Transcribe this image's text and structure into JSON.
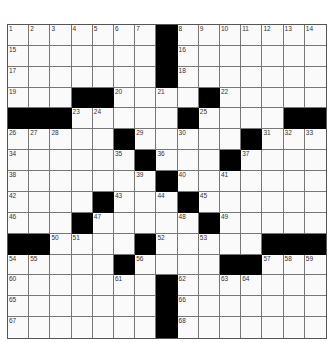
{
  "puzzle": {
    "rows": 15,
    "cols": 15,
    "colors": {
      "black": "#000000",
      "white": "#fafafa",
      "grid_line": "#777777"
    },
    "black_cells": [
      [
        0,
        7
      ],
      [
        1,
        7
      ],
      [
        2,
        7
      ],
      [
        3,
        3
      ],
      [
        3,
        4
      ],
      [
        3,
        9
      ],
      [
        4,
        0
      ],
      [
        4,
        1
      ],
      [
        4,
        2
      ],
      [
        4,
        8
      ],
      [
        4,
        13
      ],
      [
        4,
        14
      ],
      [
        5,
        5
      ],
      [
        5,
        11
      ],
      [
        6,
        6
      ],
      [
        6,
        10
      ],
      [
        7,
        7
      ],
      [
        8,
        4
      ],
      [
        8,
        8
      ],
      [
        9,
        3
      ],
      [
        9,
        9
      ],
      [
        10,
        0
      ],
      [
        10,
        1
      ],
      [
        10,
        6
      ],
      [
        10,
        12
      ],
      [
        10,
        13
      ],
      [
        10,
        14
      ],
      [
        11,
        5
      ],
      [
        11,
        10
      ],
      [
        11,
        11
      ],
      [
        12,
        7
      ],
      [
        13,
        7
      ],
      [
        14,
        7
      ]
    ],
    "numbers": [
      {
        "r": 0,
        "c": 0,
        "n": "1"
      },
      {
        "r": 0,
        "c": 1,
        "n": "2"
      },
      {
        "r": 0,
        "c": 2,
        "n": "3"
      },
      {
        "r": 0,
        "c": 3,
        "n": "4"
      },
      {
        "r": 0,
        "c": 4,
        "n": "5"
      },
      {
        "r": 0,
        "c": 5,
        "n": "6"
      },
      {
        "r": 0,
        "c": 6,
        "n": "7"
      },
      {
        "r": 0,
        "c": 8,
        "n": "8"
      },
      {
        "r": 0,
        "c": 9,
        "n": "9"
      },
      {
        "r": 0,
        "c": 10,
        "n": "10"
      },
      {
        "r": 0,
        "c": 11,
        "n": "11"
      },
      {
        "r": 0,
        "c": 12,
        "n": "12"
      },
      {
        "r": 0,
        "c": 13,
        "n": "13"
      },
      {
        "r": 0,
        "c": 14,
        "n": "14"
      },
      {
        "r": 1,
        "c": 0,
        "n": "15"
      },
      {
        "r": 1,
        "c": 8,
        "n": "16"
      },
      {
        "r": 2,
        "c": 0,
        "n": "17"
      },
      {
        "r": 2,
        "c": 8,
        "n": "18"
      },
      {
        "r": 3,
        "c": 0,
        "n": "19"
      },
      {
        "r": 3,
        "c": 5,
        "n": "20"
      },
      {
        "r": 3,
        "c": 7,
        "n": "21"
      },
      {
        "r": 3,
        "c": 10,
        "n": "22"
      },
      {
        "r": 4,
        "c": 3,
        "n": "23"
      },
      {
        "r": 4,
        "c": 4,
        "n": "24"
      },
      {
        "r": 4,
        "c": 9,
        "n": "25"
      },
      {
        "r": 5,
        "c": 0,
        "n": "26"
      },
      {
        "r": 5,
        "c": 1,
        "n": "27"
      },
      {
        "r": 5,
        "c": 2,
        "n": "28"
      },
      {
        "r": 5,
        "c": 6,
        "n": "29"
      },
      {
        "r": 5,
        "c": 8,
        "n": "30"
      },
      {
        "r": 5,
        "c": 12,
        "n": "31"
      },
      {
        "r": 5,
        "c": 13,
        "n": "32"
      },
      {
        "r": 5,
        "c": 14,
        "n": "33"
      },
      {
        "r": 6,
        "c": 0,
        "n": "34"
      },
      {
        "r": 6,
        "c": 5,
        "n": "35"
      },
      {
        "r": 6,
        "c": 7,
        "n": "36"
      },
      {
        "r": 6,
        "c": 11,
        "n": "37"
      },
      {
        "r": 7,
        "c": 0,
        "n": "38"
      },
      {
        "r": 7,
        "c": 6,
        "n": "39"
      },
      {
        "r": 7,
        "c": 8,
        "n": "40"
      },
      {
        "r": 7,
        "c": 10,
        "n": "41"
      },
      {
        "r": 8,
        "c": 0,
        "n": "42"
      },
      {
        "r": 8,
        "c": 5,
        "n": "43"
      },
      {
        "r": 8,
        "c": 7,
        "n": "44"
      },
      {
        "r": 8,
        "c": 9,
        "n": "45"
      },
      {
        "r": 9,
        "c": 0,
        "n": "46"
      },
      {
        "r": 9,
        "c": 4,
        "n": "47"
      },
      {
        "r": 9,
        "c": 8,
        "n": "48"
      },
      {
        "r": 9,
        "c": 10,
        "n": "49"
      },
      {
        "r": 10,
        "c": 2,
        "n": "50"
      },
      {
        "r": 10,
        "c": 3,
        "n": "51"
      },
      {
        "r": 10,
        "c": 7,
        "n": "52"
      },
      {
        "r": 10,
        "c": 9,
        "n": "53"
      },
      {
        "r": 11,
        "c": 0,
        "n": "54"
      },
      {
        "r": 11,
        "c": 1,
        "n": "55"
      },
      {
        "r": 11,
        "c": 6,
        "n": "56"
      },
      {
        "r": 11,
        "c": 12,
        "n": "57"
      },
      {
        "r": 11,
        "c": 13,
        "n": "58"
      },
      {
        "r": 11,
        "c": 14,
        "n": "59"
      },
      {
        "r": 12,
        "c": 0,
        "n": "60"
      },
      {
        "r": 12,
        "c": 5,
        "n": "61"
      },
      {
        "r": 12,
        "c": 8,
        "n": "62"
      },
      {
        "r": 12,
        "c": 10,
        "n": "63"
      },
      {
        "r": 12,
        "c": 11,
        "n": "64"
      },
      {
        "r": 13,
        "c": 0,
        "n": "65"
      },
      {
        "r": 13,
        "c": 8,
        "n": "66"
      },
      {
        "r": 14,
        "c": 0,
        "n": "67"
      },
      {
        "r": 14,
        "c": 8,
        "n": "68"
      }
    ]
  }
}
